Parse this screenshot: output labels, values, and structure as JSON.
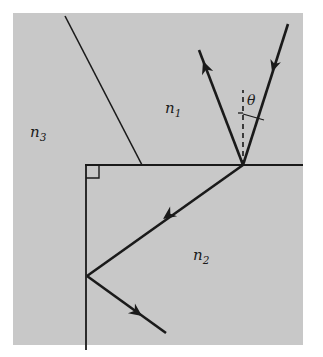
{
  "figure": {
    "kind": "optics-ray-diagram",
    "background_color": "#ffffff",
    "medium_fill_color": "#c8c8c8",
    "stroke_color": "#1a1a1a",
    "canvas": {
      "width": 323,
      "height": 357
    }
  },
  "medium_region": {
    "name": "gray-medium-block",
    "x": 13,
    "y": 13,
    "width": 290,
    "height": 332
  },
  "labels": {
    "n1": {
      "base": "n",
      "sub": "1",
      "x": 165,
      "y": 113
    },
    "n2": {
      "base": "n",
      "sub": "2",
      "x": 193,
      "y": 260
    },
    "n3": {
      "base": "n",
      "sub": "3",
      "x": 30,
      "y": 137
    },
    "theta": {
      "text": "θ",
      "x": 247,
      "y": 105
    }
  },
  "interfaces": [
    {
      "name": "horizontal-interface",
      "x1": 85,
      "y1": 165,
      "x2": 303,
      "y2": 165
    },
    {
      "name": "vertical-interface",
      "x1": 86,
      "y1": 165,
      "x2": 86,
      "y2": 350
    },
    {
      "name": "slanted-interface",
      "x1": 65,
      "y1": 16,
      "x2": 142,
      "y2": 165
    }
  ],
  "right_angle_marker": {
    "name": "right-angle-square",
    "x": 86,
    "y": 165,
    "size": 13
  },
  "normal_line": {
    "name": "dashed-normal",
    "x1": 243,
    "y1": 165,
    "x2": 243,
    "y2": 90,
    "dash": "5,4"
  },
  "angle_marker": {
    "name": "theta-angle-tick",
    "vertex_x": 243,
    "vertex_y": 165,
    "tick_x1": 238,
    "tick_y1": 113,
    "tick_x2": 243,
    "tick_y2": 113,
    "arc_x": 243,
    "arc_y": 113,
    "arc_end_x": 264,
    "arc_end_y": 118
  },
  "rays": [
    {
      "name": "incident-ray",
      "description": "incoming beam from upper right striking the interface",
      "x1": 288,
      "y1": 24,
      "x2": 243,
      "y2": 165,
      "arrowhead": {
        "x": 272,
        "y": 72,
        "angle": 107.7
      }
    },
    {
      "name": "reflected-ray",
      "description": "partially reflected beam leaving toward upper left",
      "x1": 243,
      "y1": 165,
      "x2": 199,
      "y2": 50,
      "arrowhead": {
        "x": 203,
        "y": 61,
        "angle": -110.9
      }
    },
    {
      "name": "refracted-ray-down-left",
      "description": "transmitted beam travelling down-left to the vertical interface",
      "x1": 243,
      "y1": 165,
      "x2": 87,
      "y2": 276,
      "arrowhead": {
        "x": 163,
        "y": 219,
        "angle": 144.6
      }
    },
    {
      "name": "reflected-ray-lower",
      "description": "beam reflected at the vertical interface travelling down-right",
      "x1": 87,
      "y1": 276,
      "x2": 166,
      "y2": 333,
      "arrowhead": {
        "x": 142,
        "y": 316,
        "angle": 35.8
      }
    }
  ]
}
